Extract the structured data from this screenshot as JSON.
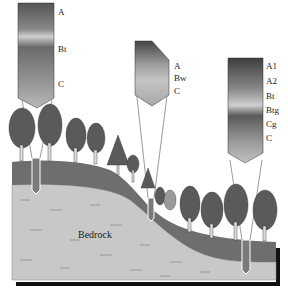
{
  "diagram": {
    "type": "soil-catena-cross-section",
    "profiles": [
      {
        "id": "upland",
        "position": "hilltop",
        "horizons": [
          "A",
          "Bt",
          "C"
        ]
      },
      {
        "id": "midslope",
        "position": "slope",
        "horizons": [
          "A",
          "Bw",
          "C"
        ]
      },
      {
        "id": "lowland",
        "position": "valley bottom",
        "horizons": [
          "A1",
          "A2",
          "Bt",
          "Btg",
          "Cg",
          "C"
        ]
      }
    ],
    "labels": {
      "bedrock": "Bedrock"
    },
    "colors": {
      "soil_layer": "#6e6e6e",
      "bedrock": "#c8c8c8",
      "tree_foliage": "#5a5a5a",
      "profile_dark": "#4a4a4a",
      "profile_light": "#bdbdbd"
    }
  }
}
